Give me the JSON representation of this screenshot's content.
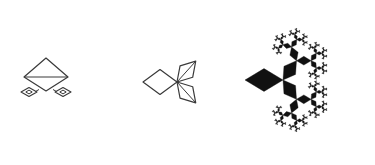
{
  "figure": {
    "canvas": {
      "width": 375,
      "height": 165
    },
    "background_color": "#ffffff",
    "stroke_color": "#3a3a3a",
    "fill_color": "#111111",
    "panels": [
      {
        "id": "panel-1",
        "label": "stage-1",
        "style": "outline",
        "center_x": 46,
        "center_y": 80,
        "element_count": 3,
        "notes": "One large outlined rhombus with a horizontal median line, plus two small outlined rhombi below the left and right corners, each containing a tiny inner rhombus."
      },
      {
        "id": "panel-2",
        "label": "stage-2",
        "style": "outline",
        "center_x": 167,
        "center_y": 82,
        "element_count": 3,
        "notes": "One large outlined rhombus at the left joined at its right vertex to two smaller rhombi angled up-right and down-right, each crossed by an interior diagonal."
      },
      {
        "id": "panel-3",
        "label": "stage-n",
        "style": "filled",
        "center_x": 305,
        "center_y": 80,
        "element_count": 255,
        "notes": "Fully developed filled-black fractal: a root rhombus pointing left whose right vertex spawns two branch rhombi, recursively repeated to 7 levels, forming a circular lace-like canopy."
      }
    ],
    "fractal": {
      "type": "binary-rhombus-tree",
      "depth": 7,
      "branch_angle_degrees": 55,
      "scale_ratio": 0.62,
      "root_length": 38,
      "root_direction_degrees": 180,
      "symmetry": "mirror about horizontal axis"
    }
  }
}
